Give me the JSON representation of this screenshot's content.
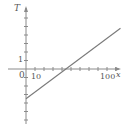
{
  "chart_data": {
    "type": "line",
    "title": "",
    "xlabel": "x",
    "ylabel": "T",
    "x_tick_labels": [
      "0",
      "10",
      "100"
    ],
    "y_tick_labels": [
      "1"
    ],
    "xlim": [
      0,
      105
    ],
    "ylim": [
      -6,
      7
    ],
    "x_tick_step": 10,
    "y_tick_step": 1,
    "grid": false,
    "legend": null,
    "series": [
      {
        "name": "T(x)",
        "x": [
          0,
          105
        ],
        "y": [
          -3.5,
          4.8
        ]
      }
    ],
    "annotations": []
  },
  "labels": {
    "y_axis": "T",
    "x_axis": "x",
    "origin": "0",
    "x_tick_10": "10",
    "x_tick_100": "100",
    "y_tick_1": "1"
  },
  "colors": {
    "axis": "#8a8a8a",
    "line": "#7a7a7a",
    "text": "#555555"
  }
}
